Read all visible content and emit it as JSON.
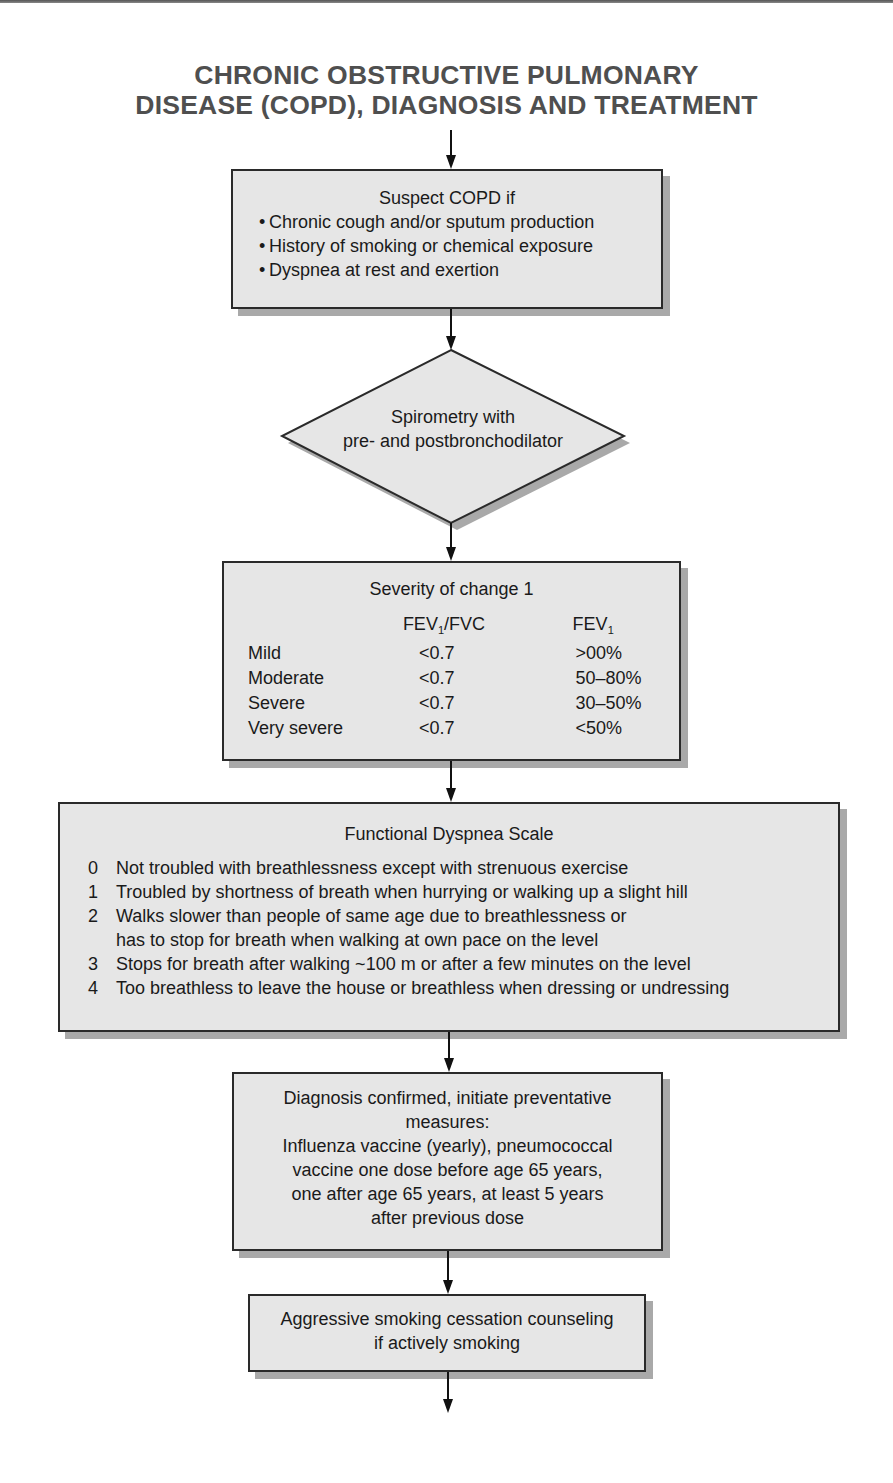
{
  "title": {
    "line1": "CHRONIC OBSTRUCTIVE PULMONARY",
    "line2": "DISEASE (COPD), DIAGNOSIS AND TREATMENT"
  },
  "suspect_box": {
    "heading": "Suspect COPD if",
    "bullet_glyph": "•",
    "items": [
      "Chronic cough and/or sputum production",
      "History of smoking or chemical exposure",
      "Dyspnea at rest and exertion"
    ]
  },
  "decision": {
    "line1": "Spirometry with",
    "line2": "pre- and postbronchodilator"
  },
  "severity_box": {
    "heading": "Severity of change 1",
    "col_headers": {
      "ratio_main": "FEV",
      "ratio_sub": "1",
      "ratio_tail": "/FVC",
      "fev_main": "FEV",
      "fev_sub": "1"
    },
    "rows": [
      {
        "label": "Mild",
        "ratio": "<0.7",
        "fev1": ">00%"
      },
      {
        "label": "Moderate",
        "ratio": "<0.7",
        "fev1": "50–80%"
      },
      {
        "label": "Severe",
        "ratio": "<0.7",
        "fev1": "30–50%"
      },
      {
        "label": "Very severe",
        "ratio": "<0.7",
        "fev1": "<50%"
      }
    ]
  },
  "dyspnea_box": {
    "heading": "Functional Dyspnea Scale",
    "items": [
      {
        "grade": "0",
        "text": "Not troubled with breathlessness except with strenuous exercise"
      },
      {
        "grade": "1",
        "text": "Troubled by shortness of breath when hurrying or walking up a slight hill"
      },
      {
        "grade": "2",
        "text": "Walks slower than people of same age due to breathlessness or"
      },
      {
        "grade": "",
        "text": "has to stop for breath when walking at own pace on the level"
      },
      {
        "grade": "3",
        "text": "Stops for breath after walking ~100 m or after a few minutes on the level"
      },
      {
        "grade": "4",
        "text": "Too breathless to leave the house or breathless when dressing or undressing"
      }
    ]
  },
  "diagnosis_box": {
    "lines": [
      "Diagnosis confirmed, initiate preventative",
      "measures:",
      "Influenza vaccine (yearly), pneumococcal",
      "vaccine one dose before age 65 years,",
      "one after age 65 years, at least 5 years",
      "after previous dose"
    ]
  },
  "smoking_box": {
    "lines": [
      "Aggressive smoking cessation counseling",
      "if actively smoking"
    ]
  },
  "colors": {
    "box_fill": "#e6e6e6",
    "box_border": "#2a2a2a",
    "box_shadow": "#a9a9a9",
    "title_text": "#4f4f4f",
    "arrow": "#111111"
  }
}
